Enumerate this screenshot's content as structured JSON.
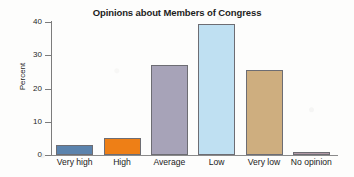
{
  "chart_data": {
    "type": "bar",
    "title": "Opinions about Members of Congress",
    "xlabel": "",
    "ylabel": "Percent",
    "categories": [
      "Very high",
      "High",
      "Average",
      "Low",
      "Very low",
      "No opinion"
    ],
    "values": [
      3,
      5,
      27,
      39.5,
      25.5,
      1
    ],
    "ylim": [
      0,
      40
    ],
    "yticks": [
      0,
      10,
      20,
      30,
      40
    ],
    "ytick_labels": [
      "0",
      "10",
      "20",
      "30",
      "40"
    ],
    "grid": false,
    "legend": "none",
    "bar_colors": [
      "#5b83ad",
      "#ee7f16",
      "#a7a3b8",
      "#bfe0f2",
      "#ceae7f",
      "#b29aa6"
    ],
    "bar_edge_color": "#6d6d73",
    "axis_color": "#7c7c7c",
    "background": "#fdfdfc"
  }
}
